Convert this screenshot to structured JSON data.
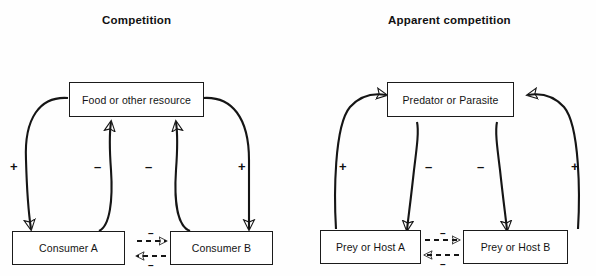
{
  "figure": {
    "width": 596,
    "height": 276,
    "background": "#fefefe",
    "stroke_color": "#151515",
    "text_color": "#141414"
  },
  "panels": [
    {
      "id": "competition",
      "title": "Competition",
      "nodes": {
        "top": "Food or other resource",
        "bottom_left": "Consumer A",
        "bottom_right": "Consumer B"
      },
      "links": [
        {
          "from": "Food or other resource",
          "to": "Consumer A",
          "sign": "+",
          "style": "solid",
          "direction": "down"
        },
        {
          "from": "Consumer A",
          "to": "Food or other resource",
          "sign": "–",
          "style": "solid",
          "direction": "up"
        },
        {
          "from": "Consumer B",
          "to": "Food or other resource",
          "sign": "–",
          "style": "solid",
          "direction": "up"
        },
        {
          "from": "Food or other resource",
          "to": "Consumer B",
          "sign": "+",
          "style": "solid",
          "direction": "down"
        },
        {
          "from": "Consumer A",
          "to": "Consumer B",
          "sign": "–",
          "style": "dashed",
          "direction": "right"
        },
        {
          "from": "Consumer B",
          "to": "Consumer A",
          "sign": "–",
          "style": "dashed",
          "direction": "left"
        }
      ],
      "signs": {
        "outer_left": "+",
        "inner_left": "–",
        "inner_right": "–",
        "outer_right": "+"
      },
      "dashed_signs": {
        "upper": "–",
        "lower": "–"
      }
    },
    {
      "id": "apparent-competition",
      "title": "Apparent competition",
      "nodes": {
        "top": "Predator or Parasite",
        "bottom_left": "Prey or Host A",
        "bottom_right": "Prey or Host B"
      },
      "links": [
        {
          "from": "Prey or Host A",
          "to": "Predator or Parasite",
          "sign": "+",
          "style": "solid",
          "direction": "up"
        },
        {
          "from": "Predator or Parasite",
          "to": "Prey or Host A",
          "sign": "–",
          "style": "solid",
          "direction": "down"
        },
        {
          "from": "Predator or Parasite",
          "to": "Prey or Host B",
          "sign": "–",
          "style": "solid",
          "direction": "down"
        },
        {
          "from": "Prey or Host B",
          "to": "Predator or Parasite",
          "sign": "+",
          "style": "solid",
          "direction": "up"
        },
        {
          "from": "Prey or Host A",
          "to": "Prey or Host B",
          "sign": "–",
          "style": "dashed",
          "direction": "right"
        },
        {
          "from": "Prey or Host B",
          "to": "Prey or Host A",
          "sign": "–",
          "style": "dashed",
          "direction": "left"
        }
      ],
      "signs": {
        "outer_left": "+",
        "inner_left": "–",
        "inner_right": "–",
        "outer_right": "+"
      },
      "dashed_signs": {
        "upper": "–",
        "lower": "–"
      }
    }
  ]
}
